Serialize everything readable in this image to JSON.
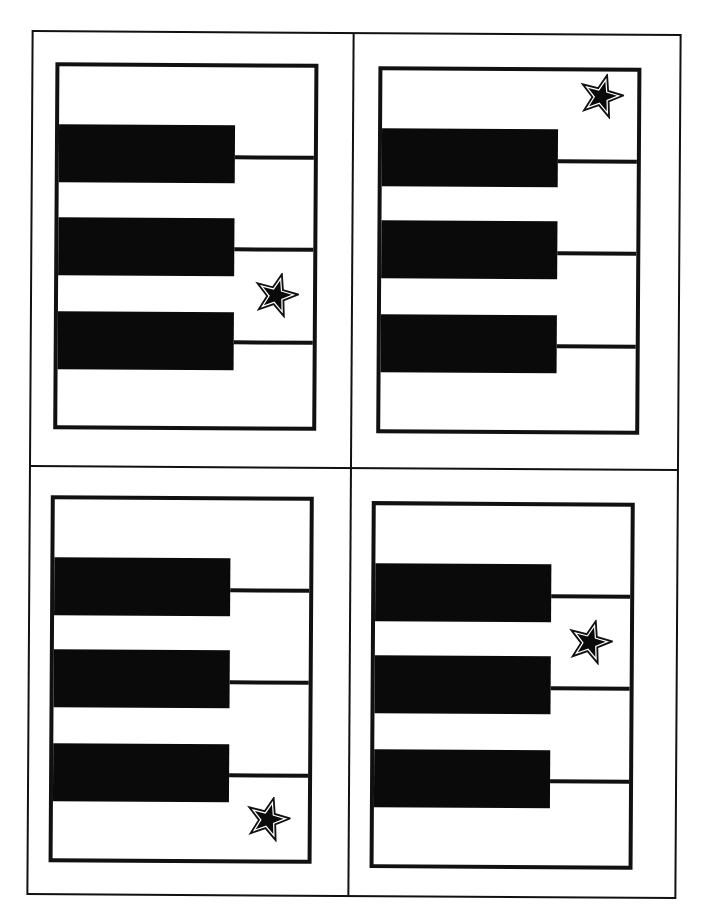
{
  "sheet": {
    "layout": "2x2 grid of piano-key flash cards",
    "colors": {
      "ink": "#111111",
      "paper": "#ffffff",
      "key": "#0a0a0a"
    }
  },
  "cards": [
    {
      "position": "top-left",
      "black_keys": 3,
      "star_icon": "star-icon",
      "star_location": "between black keys 2 and 3, right side"
    },
    {
      "position": "top-right",
      "black_keys": 3,
      "star_icon": "star-icon",
      "star_location": "above black key 1, right side"
    },
    {
      "position": "bottom-left",
      "black_keys": 3,
      "star_icon": "star-icon",
      "star_location": "below black key 3, right side"
    },
    {
      "position": "bottom-right",
      "black_keys": 3,
      "star_icon": "star-icon",
      "star_location": "between black keys 1 and 2, right side"
    }
  ]
}
